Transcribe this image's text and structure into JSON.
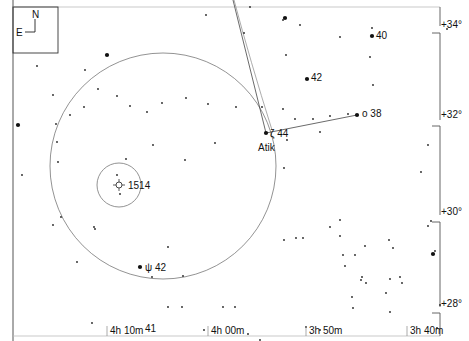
{
  "chart": {
    "orientation": {
      "north": "N",
      "east": "E"
    },
    "dec_labels": [
      {
        "text": "+34°",
        "x": 444,
        "y": 28
      },
      {
        "text": "+32°",
        "x": 444,
        "y": 118
      },
      {
        "text": "+30°",
        "x": 444,
        "y": 215
      },
      {
        "text": "+28°",
        "x": 444,
        "y": 307
      }
    ],
    "ra_labels": [
      {
        "text": "4h 10m",
        "x": 110,
        "y": 334
      },
      {
        "text": "4h 00m",
        "x": 211,
        "y": 334
      },
      {
        "text": "3h 50m",
        "x": 309,
        "y": 334
      },
      {
        "text": "3h 40m",
        "x": 410,
        "y": 334
      }
    ],
    "named_stars": [
      {
        "label": "40",
        "x": 372,
        "y": 36,
        "lx": 376,
        "ly": 35
      },
      {
        "label": "42",
        "x": 307,
        "y": 79,
        "lx": 311,
        "ly": 77
      },
      {
        "label": "o 38",
        "x": 357,
        "y": 115,
        "lx": 362,
        "ly": 113
      },
      {
        "label": "ζ 44",
        "x": 266,
        "y": 133,
        "lx": 270,
        "ly": 133
      },
      {
        "label": "Atik",
        "x": 266,
        "y": 133,
        "lx": 258,
        "ly": 147
      },
      {
        "label": "ψ 42",
        "x": 140,
        "y": 267,
        "lx": 145,
        "ly": 267
      },
      {
        "label": "41",
        "x": 142,
        "y": 330,
        "lx": 145,
        "ly": 328
      }
    ],
    "object": {
      "label": "1514",
      "x": 119,
      "y": 185
    },
    "fov_circle": {
      "cx": 163,
      "cy": 166,
      "r": 113
    },
    "small_circle": {
      "cx": 119,
      "cy": 185,
      "r": 22
    },
    "stars": [
      [
        107,
        55
      ],
      [
        37,
        66
      ],
      [
        85,
        70
      ],
      [
        53,
        95
      ],
      [
        84,
        107
      ],
      [
        70,
        115
      ],
      [
        56,
        124
      ],
      [
        22,
        175
      ],
      [
        98,
        89
      ],
      [
        117,
        96
      ],
      [
        57,
        142
      ],
      [
        58,
        162
      ],
      [
        130,
        106
      ],
      [
        147,
        112
      ],
      [
        162,
        103
      ],
      [
        186,
        98
      ],
      [
        208,
        104
      ],
      [
        236,
        107
      ],
      [
        215,
        143
      ],
      [
        185,
        160
      ],
      [
        153,
        145
      ],
      [
        126,
        159
      ],
      [
        117,
        175
      ],
      [
        120,
        194
      ],
      [
        61,
        217
      ],
      [
        53,
        225
      ],
      [
        94,
        227
      ],
      [
        95,
        229
      ],
      [
        77,
        262
      ],
      [
        168,
        247
      ],
      [
        183,
        276
      ],
      [
        152,
        277
      ],
      [
        182,
        307
      ],
      [
        168,
        307
      ],
      [
        223,
        307
      ],
      [
        235,
        307
      ],
      [
        92,
        323
      ],
      [
        204,
        330
      ],
      [
        248,
        334
      ],
      [
        283,
        20
      ],
      [
        300,
        25
      ],
      [
        372,
        28
      ],
      [
        447,
        29
      ],
      [
        286,
        55
      ],
      [
        370,
        57
      ],
      [
        373,
        85
      ],
      [
        340,
        37
      ],
      [
        244,
        33
      ],
      [
        262,
        107
      ],
      [
        283,
        109
      ],
      [
        295,
        119
      ],
      [
        313,
        119
      ],
      [
        330,
        116
      ],
      [
        348,
        114
      ],
      [
        287,
        140
      ],
      [
        320,
        132
      ],
      [
        340,
        220
      ],
      [
        284,
        168
      ],
      [
        284,
        240
      ],
      [
        296,
        238
      ],
      [
        303,
        238
      ],
      [
        330,
        227
      ],
      [
        340,
        236
      ],
      [
        343,
        255
      ],
      [
        345,
        266
      ],
      [
        355,
        255
      ],
      [
        365,
        246
      ],
      [
        389,
        240
      ],
      [
        393,
        248
      ],
      [
        362,
        277
      ],
      [
        361,
        280
      ],
      [
        366,
        283
      ],
      [
        390,
        279
      ],
      [
        400,
        277
      ],
      [
        402,
        283
      ],
      [
        386,
        293
      ],
      [
        421,
        172
      ],
      [
        428,
        145
      ],
      [
        428,
        226
      ],
      [
        431,
        221
      ],
      [
        435,
        251
      ],
      [
        440,
        305
      ],
      [
        437,
        328
      ],
      [
        352,
        297
      ],
      [
        353,
        308
      ],
      [
        390,
        312
      ],
      [
        306,
        327
      ],
      [
        320,
        330
      ],
      [
        260,
        340
      ],
      [
        206,
        15
      ],
      [
        250,
        7
      ]
    ],
    "bright_stars": [
      [
        372,
        36
      ],
      [
        307,
        79
      ],
      [
        357,
        115
      ],
      [
        266,
        133
      ],
      [
        140,
        267
      ],
      [
        18,
        125
      ],
      [
        433,
        254
      ],
      [
        285,
        18
      ],
      [
        107,
        55
      ]
    ]
  }
}
